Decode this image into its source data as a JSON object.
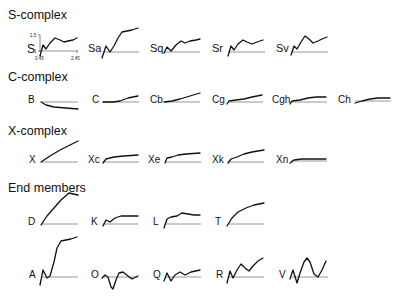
{
  "figure": {
    "sections": [
      {
        "title": "S-complex",
        "classes": [
          "S",
          "Sa",
          "Sq",
          "Sr",
          "Sv"
        ]
      },
      {
        "title": "C-complex",
        "classes": [
          "B",
          "C",
          "Cb",
          "Cg",
          "Cgh",
          "Ch"
        ]
      },
      {
        "title": "X-complex",
        "classes": [
          "X",
          "Xc",
          "Xe",
          "Xk",
          "Xn"
        ]
      },
      {
        "title": "End members",
        "classes": [
          "D",
          "K",
          "L",
          "T",
          "A",
          "O",
          "Q",
          "R",
          "V"
        ]
      }
    ],
    "axis_example": {
      "class": "S",
      "y_top_label": "1.5",
      "y_base_label": "1",
      "x_min_label": "0.45",
      "x_max_label": "2.45"
    },
    "colors": {
      "curve": "#111111",
      "baseline": "#8a8a8a",
      "background": "#ffffff"
    }
  }
}
